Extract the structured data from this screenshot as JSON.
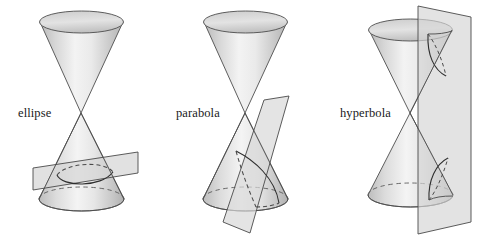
{
  "figure": {
    "background_color": "#ffffff",
    "width": 478,
    "height": 245
  },
  "style": {
    "outline_color": "#4d4d4d",
    "cone_fill_light": "#f2f2f2",
    "cone_fill_mid": "#d2d2d2",
    "cone_fill_dark": "#b8b8b8",
    "plane_fill": "#d8d8d8",
    "plane_outline": "#4a4a4a",
    "dashed_color": "#5a5a5a",
    "curve_color": "#333333",
    "label_color": "#1a1a1a"
  },
  "panels": [
    {
      "id": "ellipse",
      "label": "ellipse",
      "label_x": 18,
      "label_y": 117,
      "apex_x": 81,
      "apex_y": 113,
      "description": "Double cone cut by a slanted plane across one nappe producing a closed oval curve"
    },
    {
      "id": "parabola",
      "label": "parabola",
      "label_x": 176,
      "label_y": 117,
      "apex_x": 245,
      "apex_y": 113,
      "description": "Double cone cut by a plane parallel to a generating line producing an open curve"
    },
    {
      "id": "hyperbola",
      "label": "hyperbola",
      "label_x": 340,
      "label_y": 117,
      "apex_x": 410,
      "apex_y": 113,
      "description": "Double cone cut by a vertical plane meeting both nappes producing two branches"
    }
  ]
}
